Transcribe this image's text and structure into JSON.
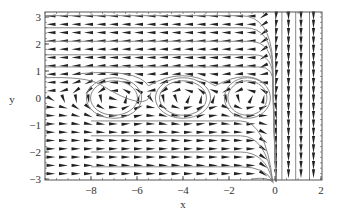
{
  "chart_data": {
    "type": "vector_field_streamplot",
    "title": "",
    "xlabel": "x",
    "ylabel": "y",
    "xlim": [
      -10,
      2
    ],
    "ylim": [
      -3.15,
      3.2
    ],
    "x_ticks": [
      -8,
      -6,
      -4,
      -2,
      0,
      2
    ],
    "x_tick_labels": [
      "−8",
      "−6",
      "−4",
      "−2",
      "0",
      "2"
    ],
    "y_ticks": [
      -3,
      -2,
      -1,
      0,
      1,
      2,
      3
    ],
    "y_tick_labels": [
      "−3",
      "−2",
      "−1",
      "0",
      "1",
      "2",
      "3"
    ],
    "grid": false,
    "legend": null,
    "cells": [
      {
        "cx": -7,
        "cy": 0,
        "rx": 1.2,
        "ry": 0.75
      },
      {
        "cx": -4,
        "cy": 0,
        "rx": 1.2,
        "ry": 0.75
      },
      {
        "cx": -1.2,
        "cy": 0,
        "rx": 1.0,
        "ry": 0.75
      }
    ],
    "colors": {
      "frame": "#555555",
      "arrows": "#222222",
      "streamlines": "#888888"
    }
  }
}
